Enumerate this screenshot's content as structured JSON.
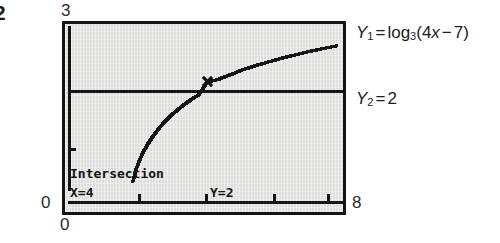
{
  "figure": {
    "number": "2"
  },
  "axis_labels": {
    "y_max": "3",
    "y_min": "0",
    "x_min": "0",
    "x_max": "8"
  },
  "calculator": {
    "readout_title": "Intersection",
    "readout_x": "X=4",
    "readout_y": "Y=2"
  },
  "equations": {
    "y1": {
      "name": "Y",
      "sub": "1",
      "equals": "=",
      "func": "log",
      "base": "3",
      "open": "(",
      "coef": "4",
      "var": "x",
      "minus": "−",
      "const": "7",
      "close": ")",
      "full": "Y1 = log3(4x − 7)"
    },
    "y2": {
      "name": "Y",
      "sub": "2",
      "equals": "=",
      "value": "2",
      "full": "Y2 = 2"
    }
  },
  "colors": {
    "screen_background": "#dededc",
    "ink": "#141414",
    "page_background": "#ffffff",
    "text": "#1c1c1c"
  },
  "chart_data": {
    "type": "line",
    "title": "",
    "subtitle": "",
    "xlabel": "",
    "ylabel": "",
    "xlim": [
      0,
      8
    ],
    "ylim": [
      0,
      3
    ],
    "grid": false,
    "legend_position": "right",
    "x_ticks": [
      2,
      4,
      6
    ],
    "y_ticks": [
      1
    ],
    "annotations": [
      {
        "text": "Intersection",
        "x": 0.1,
        "y": 0.35
      },
      {
        "text": "X=4",
        "x": 0.1,
        "y": 0.12
      },
      {
        "text": "Y=2",
        "x": 4.1,
        "y": 0.12
      }
    ],
    "intersection": {
      "x": 4,
      "y": 2,
      "label": "X=4  Y=2"
    },
    "series": [
      {
        "name": "Y1 = log3(4x − 7)",
        "style": "dotted-curve",
        "x": [
          1.8,
          1.9,
          2.0,
          2.1,
          2.25,
          2.4,
          2.6,
          2.8,
          3.0,
          3.25,
          3.5,
          3.75,
          4.0,
          4.3,
          4.6,
          5.0,
          5.4,
          5.8,
          6.2,
          6.6,
          7.0,
          7.4,
          7.8
        ],
        "y": [
          0.19,
          0.42,
          0.58,
          0.72,
          0.88,
          1.02,
          1.18,
          1.31,
          1.43,
          1.56,
          1.67,
          1.77,
          2.0,
          2.04,
          2.11,
          2.21,
          2.29,
          2.36,
          2.43,
          2.49,
          2.55,
          2.6,
          2.65
        ]
      },
      {
        "name": "Y2 = 2",
        "style": "solid-horizontal",
        "x": [
          0,
          8
        ],
        "y": [
          2,
          2
        ]
      }
    ]
  }
}
